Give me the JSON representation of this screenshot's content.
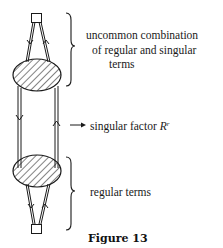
{
  "figure": {
    "caption": "Figure 13",
    "labels": {
      "top_bracket": [
        "uncommon combination",
        "of regular and singular",
        "terms"
      ],
      "middle_arrow_label": "singular factor",
      "middle_symbol": "R",
      "middle_symbol_superscript": "r",
      "bottom_bracket": "regular terms"
    },
    "elements": {
      "top_vertex": "square",
      "top_blob": "hatched-ellipse",
      "bottom_blob": "hatched-ellipse",
      "bottom_vertex": "square",
      "arrow": "right-arrow"
    },
    "colors": {
      "ink": "#1a1a1a",
      "background": "#ffffff"
    }
  }
}
